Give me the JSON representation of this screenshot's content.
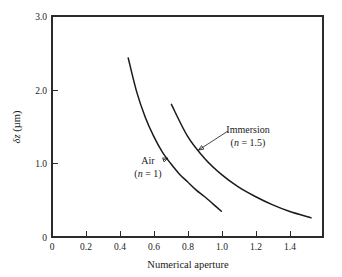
{
  "chart_data": {
    "type": "line",
    "title": "",
    "xlabel": "Numerical aperture",
    "ylabel": "δz (µm)",
    "xlim": [
      0,
      1.6
    ],
    "ylim": [
      0,
      3.0
    ],
    "xticks": [
      "0",
      "0.2",
      "0.4",
      "0.6",
      "0.8",
      "1.0",
      "1.2",
      "1.4"
    ],
    "xtick_values": [
      0,
      0.2,
      0.4,
      0.6,
      0.8,
      1.0,
      1.2,
      1.4
    ],
    "yticks": [
      "0",
      "1.0",
      "2.0",
      "3.0"
    ],
    "ytick_values": [
      0,
      1.0,
      2.0,
      3.0
    ],
    "grid": false,
    "legend": "annotations",
    "series": [
      {
        "name": "Air (n = 1)",
        "label_main": "Air",
        "label_sub": "(n = 1)",
        "color": "#1a1a1a",
        "x": [
          0.45,
          0.5,
          0.55,
          0.6,
          0.65,
          0.7,
          0.75,
          0.8,
          0.85,
          0.9,
          0.95,
          1.0
        ],
        "y": [
          2.43,
          1.97,
          1.63,
          1.37,
          1.16,
          1.0,
          0.86,
          0.75,
          0.64,
          0.55,
          0.45,
          0.35
        ]
      },
      {
        "name": "Immersion (n = 1.5)",
        "label_main": "Immersion",
        "label_sub": "(n = 1.5)",
        "color": "#1a1a1a",
        "x": [
          0.705,
          0.8,
          0.9,
          1.0,
          1.1,
          1.2,
          1.3,
          1.4,
          1.53
        ],
        "y": [
          1.8,
          1.37,
          1.07,
          0.85,
          0.68,
          0.55,
          0.44,
          0.35,
          0.26
        ]
      }
    ],
    "annotations": [
      {
        "name": "air-annotation",
        "text_main": "Air",
        "text_sub": "(n = 1)",
        "points_to_x": 0.685,
        "points_to_y": 1.07
      },
      {
        "name": "immersion-annotation",
        "text_main": "Immersion",
        "text_sub": "(n = 1.5)",
        "points_to_x": 0.865,
        "points_to_y": 1.18
      }
    ]
  },
  "axes": {
    "x_title": "Numerical aperture",
    "y_title_delta": "δ",
    "y_title_z": "z",
    "y_title_unit": " (µm)"
  }
}
